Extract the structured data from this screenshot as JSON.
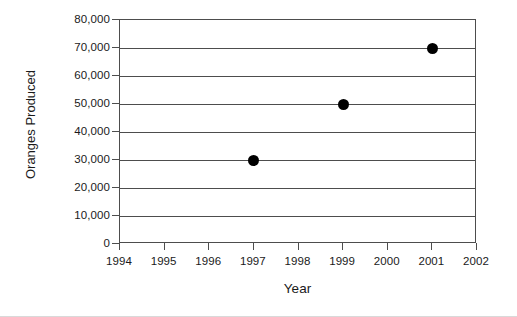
{
  "chart_data": {
    "type": "scatter",
    "title": "",
    "xlabel": "Year",
    "ylabel": "Oranges Produced",
    "x": [
      1997,
      1999,
      2001
    ],
    "values": [
      30000,
      50000,
      70000
    ],
    "points": [
      {
        "x": 1997,
        "y": 30000,
        "y_label": "30,000"
      },
      {
        "x": 1999,
        "y": 50000,
        "y_label": "50,000"
      },
      {
        "x": 2001,
        "y": 70000,
        "y_label": "70,000"
      }
    ],
    "xlim": [
      1994,
      2002
    ],
    "ylim": [
      0,
      80000
    ],
    "xtick_labels": [
      "1994",
      "1995",
      "1996",
      "1997",
      "1998",
      "1999",
      "2000",
      "2001",
      "2002"
    ],
    "xticks": [
      1994,
      1995,
      1996,
      1997,
      1998,
      1999,
      2000,
      2001,
      2002
    ],
    "ytick_labels": [
      "80,000",
      "70,000",
      "60,000",
      "50,000",
      "40,000",
      "30,000",
      "20,000",
      "10,000",
      "0"
    ],
    "yticks": [
      80000,
      70000,
      60000,
      50000,
      40000,
      30000,
      20000,
      10000,
      0
    ],
    "grid": true,
    "grid_axis": "y",
    "legend": null,
    "marker_color": "#000000",
    "axis_color": "#4d4d4d",
    "background_color": "#ffffff"
  }
}
